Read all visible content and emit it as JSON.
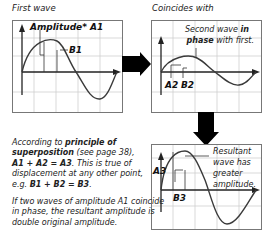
{
  "captions": {
    "first_wave": "First wave",
    "coincides_with": "Coincides with"
  },
  "panel1": {
    "label_amplitude": "Amplitude* A1",
    "label_b": "B1"
  },
  "panel2": {
    "note_line1_a": "Second wave ",
    "note_line1_b": "in",
    "note_line2_a": "phase",
    "note_line2_b": " with first.",
    "label_a": "A2",
    "label_b": "B2"
  },
  "panel3": {
    "label_a": "A3",
    "label_b": "B3",
    "note_lines": [
      "Resultant",
      "wave has",
      "greater",
      "amplitude."
    ]
  },
  "explanation": {
    "p1": {
      "t1": "According to ",
      "b1": "principle of",
      "b2": "superposition",
      "t2": " (see page 38),",
      "eq1": "A1 + A2 = A3",
      "t3": ". This is true of",
      "t4": "displacement at any other point,",
      "t5": "e.g. ",
      "eq2": "B1 + B2 = B3",
      "t6": "."
    },
    "p2": {
      "l1": "If two waves of amplitude A1 coincide",
      "l2": "in phase, the resultant amplitude is",
      "l3": "double original amplitude."
    }
  },
  "colors": {
    "grid": "#c8c8c8",
    "frame": "#555555",
    "wave": "#3a3a3a",
    "arrow": "#000000"
  }
}
